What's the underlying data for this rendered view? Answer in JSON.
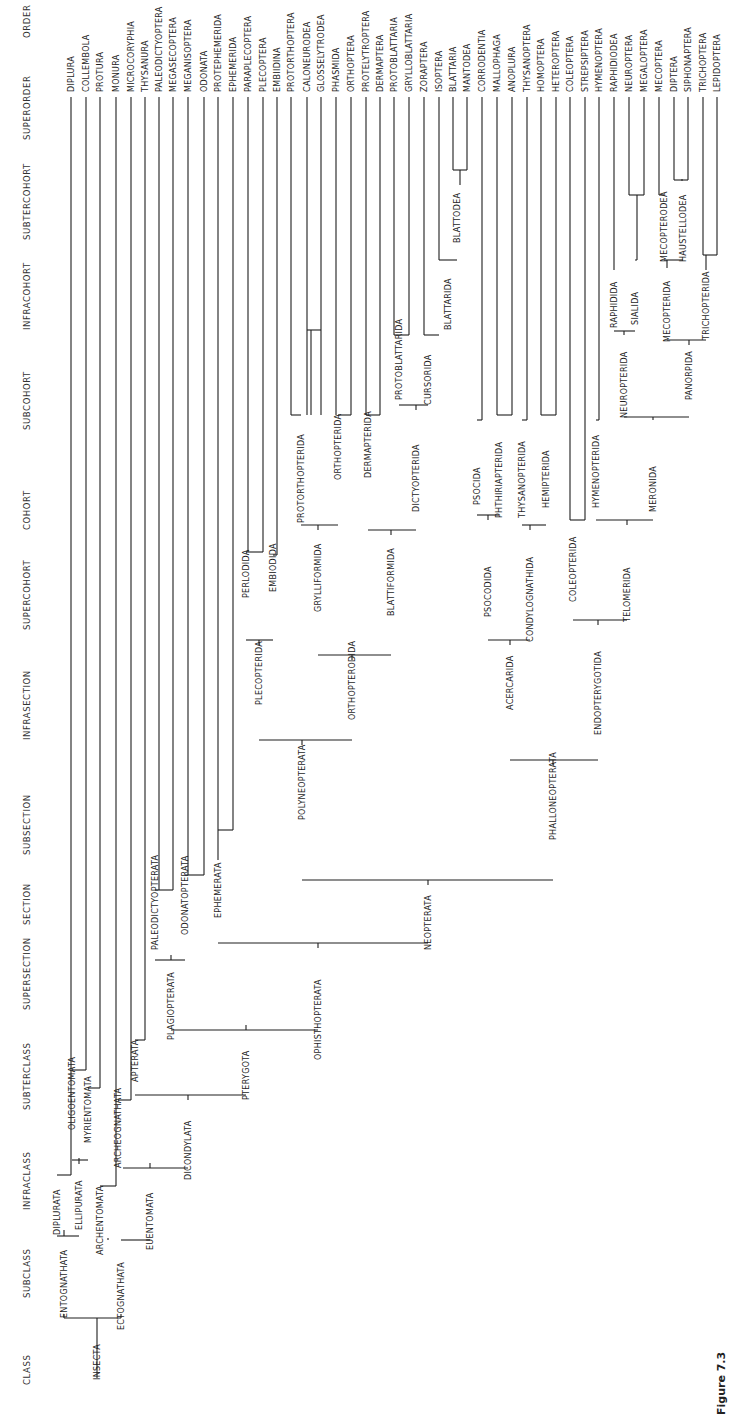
{
  "figure": {
    "orientation": "rotated -90deg (text reads bottom-to-top)",
    "caption_partial": "Figure 7.3"
  },
  "ranks": [
    {
      "label": "CLASS",
      "y": 1385
    },
    {
      "label": "SUBCLASS",
      "y": 1298
    },
    {
      "label": "INFRACLASS",
      "y": 1210
    },
    {
      "label": "SUBTERCLASS",
      "y": 1110
    },
    {
      "label": "SUPERSECTION",
      "y": 1010
    },
    {
      "label": "SECTION",
      "y": 925
    },
    {
      "label": "SUBSECTION",
      "y": 855
    },
    {
      "label": "INFRASECTION",
      "y": 740
    },
    {
      "label": "SUPERCOHORT",
      "y": 630
    },
    {
      "label": "COHORT",
      "y": 530
    },
    {
      "label": "SUBCOHORT",
      "y": 430
    },
    {
      "label": "INFRACOHORT",
      "y": 330
    },
    {
      "label": "SUBTERCOHORT",
      "y": 240
    },
    {
      "label": "SUPERORDER",
      "y": 140
    },
    {
      "label": "ORDER",
      "y": 38
    }
  ],
  "orders": [
    {
      "label": "DIPLURA",
      "x": 71
    },
    {
      "label": "COLLEMBOLA",
      "x": 86
    },
    {
      "label": "PROTURA",
      "x": 100
    },
    {
      "label": "MONURA",
      "x": 116
    },
    {
      "label": "MICROCORYPHIA",
      "x": 131
    },
    {
      "label": "THYSANURA",
      "x": 145
    },
    {
      "label": "PALEODICTYOPTERA",
      "x": 159
    },
    {
      "label": "MEGASECOPTERA",
      "x": 173
    },
    {
      "label": "MEGANISOPTERA",
      "x": 188
    },
    {
      "label": "ODONATA",
      "x": 204
    },
    {
      "label": "PROTEPHEMERIDA",
      "x": 218
    },
    {
      "label": "EPHEMERIDA",
      "x": 233
    },
    {
      "label": "PARAPLECOPTERA",
      "x": 248
    },
    {
      "label": "PLECOPTERA",
      "x": 263
    },
    {
      "label": "EMBIIDINA",
      "x": 277
    },
    {
      "label": "PROTORTHOPTERA",
      "x": 291
    },
    {
      "label": "CALONEURODEA",
      "x": 307
    },
    {
      "label": "GLOSSELYTRODEA",
      "x": 321
    },
    {
      "label": "PHASMIDA",
      "x": 336
    },
    {
      "label": "ORTHOPTERA",
      "x": 351
    },
    {
      "label": "PROTELYTROPTERA",
      "x": 366
    },
    {
      "label": "DERMAPTERA",
      "x": 380
    },
    {
      "label": "PROTOBLATTARIA",
      "x": 394
    },
    {
      "label": "GRYLLOBLATTARIA",
      "x": 409
    },
    {
      "label": "ZORAPTERA",
      "x": 424
    },
    {
      "label": "ISOPTERA",
      "x": 439
    },
    {
      "label": "BLATTARIA",
      "x": 453
    },
    {
      "label": "MANTODEA",
      "x": 467
    },
    {
      "label": "CORRODENTIA",
      "x": 482
    },
    {
      "label": "MALLOPHAGA",
      "x": 497
    },
    {
      "label": "ANOPLURA",
      "x": 512
    },
    {
      "label": "THYSANOPTERA",
      "x": 527
    },
    {
      "label": "HOMOPTERA",
      "x": 541
    },
    {
      "label": "HETEROPTERA",
      "x": 556
    },
    {
      "label": "COLEOPTERA",
      "x": 570
    },
    {
      "label": "STREPSIPTERA",
      "x": 585
    },
    {
      "label": "HYMENOPTERA",
      "x": 599
    },
    {
      "label": "RAPHIDIODEA",
      "x": 614
    },
    {
      "label": "NEUROPTERA",
      "x": 629
    },
    {
      "label": "MEGALOPTERA",
      "x": 644
    },
    {
      "label": "MECOPTERA",
      "x": 659
    },
    {
      "label": "DIPTERA",
      "x": 674
    },
    {
      "label": "SIPHONAPTERA",
      "x": 688
    },
    {
      "label": "TRICHOPTERA",
      "x": 703
    },
    {
      "label": "LEPIDOPTERA",
      "x": 717
    }
  ],
  "nodes": [
    {
      "label": "INSECTA",
      "x": 97,
      "y": 1380,
      "bold": false
    },
    {
      "label": "ENTOGNATHATA",
      "x": 64,
      "y": 1318
    },
    {
      "label": "ECTOGNATHATA",
      "x": 121,
      "y": 1330
    },
    {
      "label": "DIPLURATA",
      "x": 57,
      "y": 1235
    },
    {
      "label": "ELLIPURATA",
      "x": 79,
      "y": 1230
    },
    {
      "label": "ARCHENTOMATA",
      "x": 100,
      "y": 1255
    },
    {
      "label": "EUENTOMATA",
      "x": 150,
      "y": 1250
    },
    {
      "label": "OLIGOENTOMATA",
      "x": 72,
      "y": 1130
    },
    {
      "label": "MYRIENTOMATA",
      "x": 88,
      "y": 1143
    },
    {
      "label": "ARCHEOGNATHATA",
      "x": 118,
      "y": 1168
    },
    {
      "label": "DICONDYLATA",
      "x": 188,
      "y": 1180
    },
    {
      "label": "APTERATA",
      "x": 135,
      "y": 1082
    },
    {
      "label": "PTERYGOTA",
      "x": 246,
      "y": 1100
    },
    {
      "label": "PLAGIOPTERATA",
      "x": 171,
      "y": 1040
    },
    {
      "label": "OPHISTHOPTERATA",
      "x": 318,
      "y": 1060
    },
    {
      "label": "PALEODICTYOPTERATA",
      "x": 155,
      "y": 950
    },
    {
      "label": "ODONATOPTERATA",
      "x": 185,
      "y": 935
    },
    {
      "label": "EPHEMERATA",
      "x": 218,
      "y": 918
    },
    {
      "label": "NEOPTERATA",
      "x": 428,
      "y": 950
    },
    {
      "label": "POLYNEOPTERATA",
      "x": 302,
      "y": 820
    },
    {
      "label": "PHALLONEOPTERATA",
      "x": 553,
      "y": 840
    },
    {
      "label": "PLECOPTERIDA",
      "x": 259,
      "y": 705
    },
    {
      "label": "ORTHOPTERODIDA",
      "x": 352,
      "y": 720
    },
    {
      "label": "ACERCARIDA",
      "x": 510,
      "y": 710
    },
    {
      "label": "ENDOPTERYGOTIDA",
      "x": 598,
      "y": 735
    },
    {
      "label": "PERLODIDA",
      "x": 246,
      "y": 598
    },
    {
      "label": "EMBIODIDA",
      "x": 273,
      "y": 592
    },
    {
      "label": "GRYLLIFORMIDA",
      "x": 318,
      "y": 612
    },
    {
      "label": "BLATTIFORMIDA",
      "x": 391,
      "y": 616
    },
    {
      "label": "PSOCODIDA",
      "x": 488,
      "y": 617
    },
    {
      "label": "CONDYLOGNATHIDA",
      "x": 530,
      "y": 642
    },
    {
      "label": "COLEOPTERIDA",
      "x": 573,
      "y": 602
    },
    {
      "label": "TELOMERIDA",
      "x": 627,
      "y": 622
    },
    {
      "label": "PROTORTHOPTERIDA",
      "x": 301,
      "y": 523
    },
    {
      "label": "ORTHOPTERIDA",
      "x": 338,
      "y": 480
    },
    {
      "label": "DERMAPTERIDA",
      "x": 368,
      "y": 478
    },
    {
      "label": "DICTYOPTERIDA",
      "x": 416,
      "y": 512
    },
    {
      "label": "PSOCIDA",
      "x": 477,
      "y": 505
    },
    {
      "label": "PHTHIRIAPTERIDA",
      "x": 499,
      "y": 518
    },
    {
      "label": "THYSANOPTERIDA",
      "x": 522,
      "y": 518
    },
    {
      "label": "HEMIPTERIDA",
      "x": 546,
      "y": 508
    },
    {
      "label": "HYMENOPTERIDA",
      "x": 596,
      "y": 508
    },
    {
      "label": "MERONIDA",
      "x": 653,
      "y": 512
    },
    {
      "label": "PROTOBLATTARIDA",
      "x": 399,
      "y": 400
    },
    {
      "label": "CURSORIDA",
      "x": 428,
      "y": 405
    },
    {
      "label": "NEUROPTERIDA",
      "x": 624,
      "y": 418
    },
    {
      "label": "PANORPIDA",
      "x": 689,
      "y": 400
    },
    {
      "label": "BLATTARIDA",
      "x": 448,
      "y": 330
    },
    {
      "label": "RAPHIDIDA",
      "x": 614,
      "y": 328
    },
    {
      "label": "SIALIDA",
      "x": 635,
      "y": 325
    },
    {
      "label": "MECOPTERIDA",
      "x": 667,
      "y": 342
    },
    {
      "label": "TRICHOPTERIDA",
      "x": 706,
      "y": 340
    },
    {
      "label": "BLATTODEA",
      "x": 457,
      "y": 243
    },
    {
      "label": "MECOPTERODEA",
      "x": 664,
      "y": 262
    },
    {
      "label": "HAUSTELLODEA",
      "x": 683,
      "y": 262
    }
  ]
}
